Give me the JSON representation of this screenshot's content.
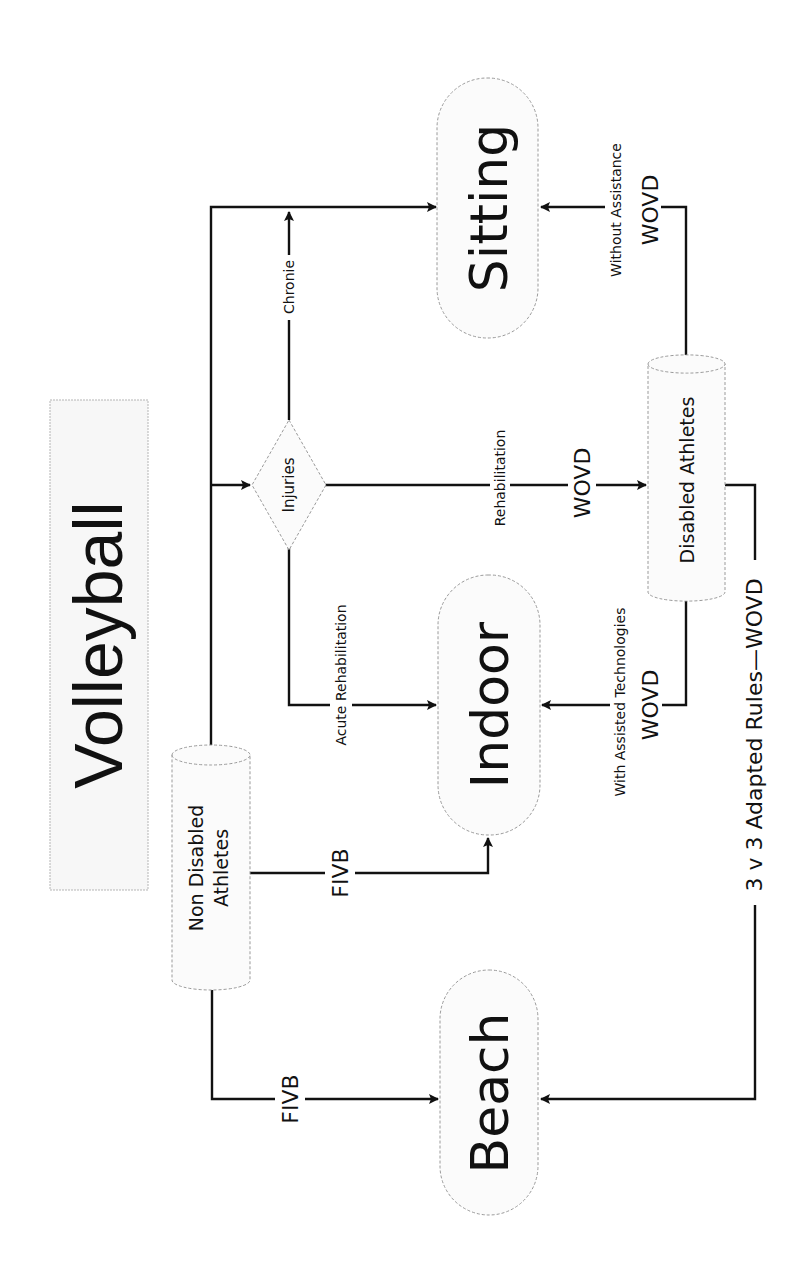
{
  "title": "Volleyball",
  "nodes": {
    "non_disabled": {
      "line1": "Non Disabled",
      "line2": "Athletes"
    },
    "disabled": {
      "label": "Disabled Athletes"
    },
    "injuries": {
      "label": "Injuries"
    },
    "beach": {
      "label": "Beach"
    },
    "indoor": {
      "label": "Indoor"
    },
    "sitting": {
      "label": "Sitting"
    }
  },
  "edges": {
    "non_disabled_to_beach": {
      "label": "FIVB"
    },
    "non_disabled_to_indoor": {
      "label": "FIVB"
    },
    "injuries_to_indoor": {
      "label": "Acute Rehabilitation"
    },
    "injuries_to_sitting": {
      "label": "Chronie"
    },
    "injuries_to_disabled": {
      "label": "Rehabilitation",
      "org": "WOVD"
    },
    "disabled_to_indoor": {
      "label": "With Assisted Technologies",
      "org": "WOVD"
    },
    "disabled_to_sitting": {
      "label": "Without Assistance",
      "org": "WOVD"
    },
    "disabled_to_beach": {
      "label": "3 v 3 Adapted Rules",
      "org": "WOVD"
    }
  },
  "colors": {
    "line": "#111111",
    "shape_border": "#9a9a9a",
    "shape_fill": "#fbfbfb",
    "background": "#ffffff"
  }
}
